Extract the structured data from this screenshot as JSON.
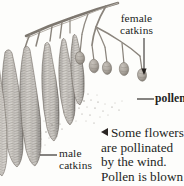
{
  "figure": {
    "kind": "botanical-illustration",
    "background_color": "#fdfdfb",
    "ink_color": "#231f1d"
  },
  "labels": {
    "female_catkins": {
      "line1": "female",
      "line2": "catkins"
    },
    "pollen": "pollen",
    "male_catkins": {
      "line1": "male",
      "line2": "catkins"
    }
  },
  "caption": {
    "marker": "◁",
    "lines": [
      "Some flowers",
      "are pollinated",
      "by the wind.",
      "Pollen is blown"
    ]
  }
}
